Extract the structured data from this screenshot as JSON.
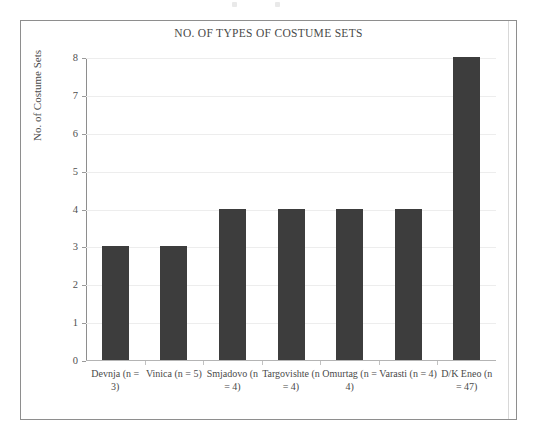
{
  "figure": {
    "title": "NO. OF TYPES OF COSTUME SETS",
    "y_axis_title": "No. of Costume Sets",
    "bar_color": "#3d3d3d",
    "frame_color": "#8e8e8e",
    "gridline_color": "#ededed"
  },
  "chart_data": {
    "type": "bar",
    "title": "NO. OF TYPES OF COSTUME SETS",
    "xlabel": "",
    "ylabel": "No. of Costume Sets",
    "ylim": [
      0,
      8
    ],
    "yticks": [
      0,
      1,
      2,
      3,
      4,
      5,
      6,
      7,
      8
    ],
    "ytick_labels": [
      "0",
      "1",
      "2",
      "3",
      "4",
      "5",
      "6",
      "7",
      "8"
    ],
    "grid": true,
    "legend": false,
    "categories": [
      "Devnja (n = 3)",
      "Vinica (n = 5)",
      "Smjadovo (n = 4)",
      "Targovishte (n = 4)",
      "Omurtag (n = 4)",
      "Varasti (n = 4)",
      "D/K Eneo (n = 47)"
    ],
    "values": [
      3,
      3,
      4,
      4,
      4,
      4,
      8
    ],
    "series": [
      {
        "name": "No. of Costume Sets",
        "values": [
          3,
          3,
          4,
          4,
          4,
          4,
          8
        ]
      }
    ],
    "sample_sizes": [
      3,
      5,
      4,
      4,
      4,
      4,
      47
    ]
  }
}
